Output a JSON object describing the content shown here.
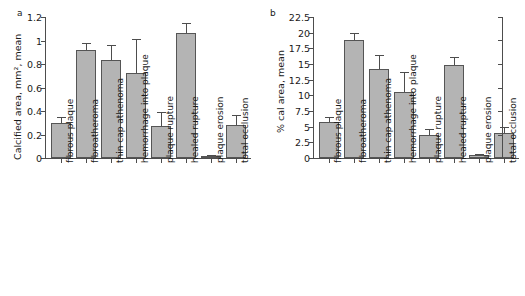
{
  "figure": {
    "panels": [
      {
        "letter": "a",
        "ylabel": "Calcified area, mm², mean",
        "yticks": [
          "0",
          "0.2",
          "0.4",
          "0.6",
          "0.8",
          "1",
          "1.2"
        ]
      },
      {
        "letter": "b",
        "ylabel": "% cal area, mean",
        "yticks": [
          "0",
          "2.5",
          "5",
          "7.5",
          "10",
          "12.5",
          "15",
          "17.5",
          "20",
          "22.5"
        ]
      }
    ]
  },
  "categories": [
    "fibrous plaque",
    "fibroatheroma",
    "thin cap athenoma",
    "hemorrhage into plaque",
    "plaque rupture",
    "healed rupture",
    "plaque erosion",
    "total occlusion"
  ],
  "colors": {
    "bar_fill": "#b4b4b4",
    "bar_edge": "#555555",
    "axis": "#4d4d4d",
    "text": "#1a1a1a",
    "background": "#ffffff"
  },
  "chart_data": [
    {
      "type": "bar",
      "title": "a",
      "xlabel": "",
      "ylabel": "Calcified area, mm², mean",
      "ylim": [
        0,
        1.2
      ],
      "ytick_values": [
        0,
        0.2,
        0.4,
        0.6,
        0.8,
        1.0,
        1.2
      ],
      "grid": false,
      "legend": "none",
      "categories": [
        "fibrous plaque",
        "fibroatheroma",
        "thin cap athenoma",
        "hemorrhage into plaque",
        "plaque rupture",
        "healed rupture",
        "plaque erosion",
        "total occlusion"
      ],
      "values": [
        0.3,
        0.92,
        0.83,
        0.72,
        0.27,
        1.06,
        0.015,
        0.28
      ],
      "errors": [
        0.05,
        0.06,
        0.13,
        0.29,
        0.12,
        0.09,
        0.01,
        0.09
      ]
    },
    {
      "type": "bar",
      "title": "b",
      "xlabel": "",
      "ylabel": "% cal area, mean",
      "ylim": [
        0,
        22.5
      ],
      "ytick_values": [
        0,
        2.5,
        5,
        7.5,
        10,
        12.5,
        15,
        17.5,
        20,
        22.5
      ],
      "grid": false,
      "legend": "none",
      "categories": [
        "fibrous plaque",
        "fibroatheroma",
        "thin cap athenoma",
        "hemorrhage into plaque",
        "plaque rupture",
        "healed rupture",
        "plaque erosion",
        "total occlusion"
      ],
      "values": [
        5.8,
        18.8,
        14.2,
        10.5,
        3.6,
        14.8,
        0.5,
        4.0
      ],
      "errors": [
        0.7,
        1.1,
        2.3,
        3.3,
        1.1,
        1.3,
        0.2,
        1.0
      ]
    }
  ]
}
